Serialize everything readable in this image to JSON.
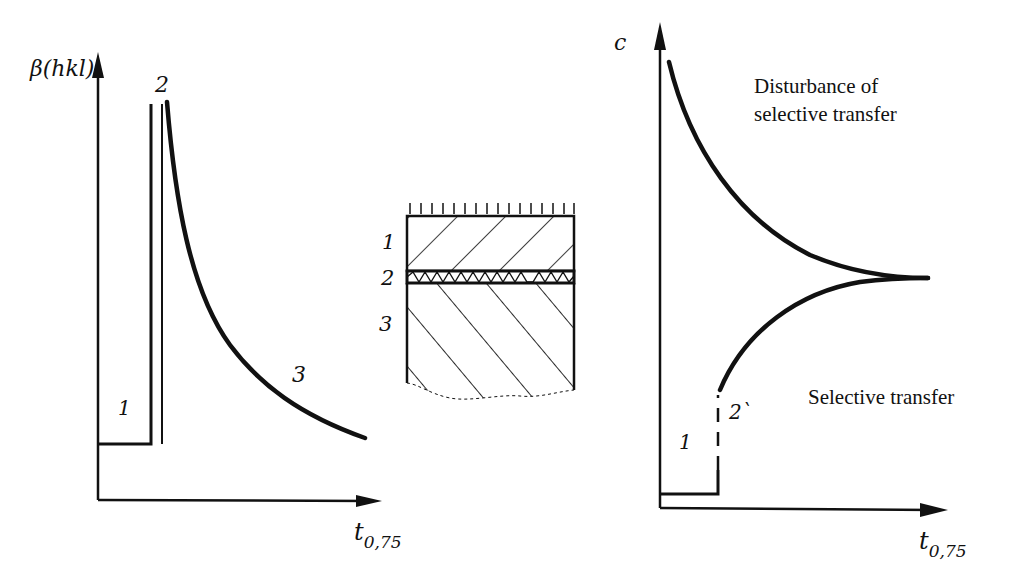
{
  "left_graph": {
    "y_axis_label": "β(hkl)",
    "x_axis_label_main": "t",
    "x_axis_label_sub": "0,75",
    "region_labels": [
      "1",
      "2",
      "3"
    ]
  },
  "layer_diagram": {
    "layer_labels": [
      "1",
      "2",
      "3"
    ]
  },
  "right_graph": {
    "y_axis_label": "c",
    "x_axis_label_main": "t",
    "x_axis_label_sub": "0,75",
    "region_labels": [
      "1",
      "2`"
    ],
    "upper_curve_label_line1": "Disturbance of",
    "upper_curve_label_line2": "selective transfer",
    "lower_curve_label": "Selective transfer"
  },
  "colors": {
    "ink": "#111111",
    "paper": "#ffffff"
  }
}
